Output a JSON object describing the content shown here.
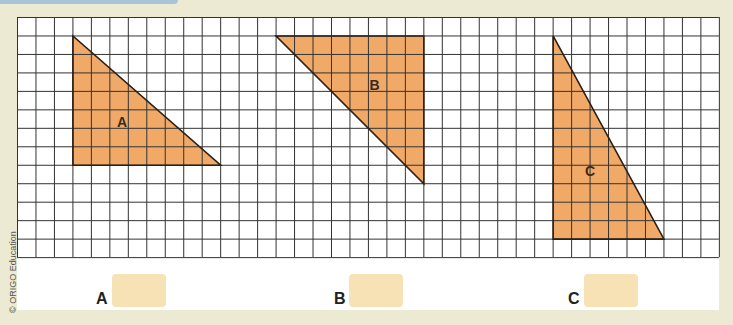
{
  "header": {
    "bar_color": "#a9c4d6"
  },
  "grid": {
    "columns": 38,
    "rows": 13,
    "cell_size": 18.47,
    "line_color": "#333333",
    "background": "#ffffff"
  },
  "shape_fill": "#f0a967",
  "triangles": [
    {
      "label": "A",
      "vertices_cells": [
        [
          3,
          1
        ],
        [
          3,
          8
        ],
        [
          11,
          8
        ]
      ],
      "width_units": 8,
      "height_units": 7
    },
    {
      "label": "B",
      "vertices_cells": [
        [
          14,
          1
        ],
        [
          22,
          1
        ],
        [
          22,
          9
        ]
      ],
      "width_units": 8,
      "height_units": 8
    },
    {
      "label": "C",
      "vertices_cells": [
        [
          29,
          1
        ],
        [
          29,
          12
        ],
        [
          35,
          12
        ]
      ],
      "width_units": 6,
      "height_units": 11
    }
  ],
  "answers": [
    {
      "label": "A",
      "value": ""
    },
    {
      "label": "B",
      "value": ""
    },
    {
      "label": "C",
      "value": ""
    }
  ],
  "copyright": "© ORIGO Education"
}
